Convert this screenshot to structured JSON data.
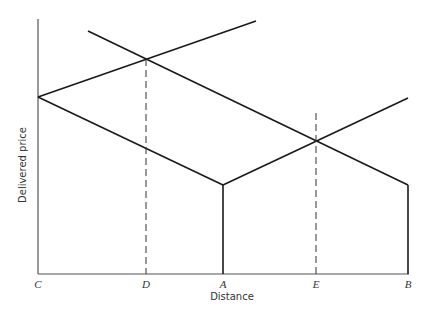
{
  "diagram": {
    "xlabel": "Distance",
    "ylabel": "Delivered price",
    "points": {
      "C": "C",
      "D": "D",
      "A": "A",
      "E": "E",
      "B": "B"
    },
    "colors": {
      "line": "#1a1a1a",
      "axis": "#555555",
      "dashed": "#333333",
      "text": "#333333"
    }
  }
}
